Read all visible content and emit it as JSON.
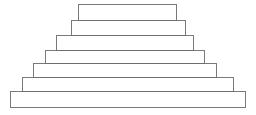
{
  "figure": {
    "background_color": "#ffffff",
    "stroke_color": "#6b6b6b",
    "fill_color": "#ffffff",
    "stroke_width": 0.9,
    "canvas": {
      "width": 256,
      "height": 115
    }
  },
  "chart_data": {
    "type": "bar",
    "title": "",
    "subtitle": "",
    "xlabel": "",
    "ylabel": "",
    "orientation": "horizontal-stacked-pyramid",
    "grid": false,
    "legend": null,
    "categories": [
      "tier-1",
      "tier-2",
      "tier-3",
      "tier-4",
      "tier-5",
      "tier-6",
      "tier-7"
    ],
    "values": [
      98,
      114,
      137,
      159,
      183,
      211,
      235
    ],
    "xlim": [
      0,
      256
    ],
    "ylim": [
      0,
      115
    ],
    "tiers": [
      {
        "index": 1,
        "label": "tier-1",
        "x": 78,
        "y": 4,
        "width": 98,
        "height": 16
      },
      {
        "index": 2,
        "label": "tier-2",
        "x": 71,
        "y": 20,
        "width": 114,
        "height": 15
      },
      {
        "index": 3,
        "label": "tier-3",
        "x": 56,
        "y": 35,
        "width": 137,
        "height": 15
      },
      {
        "index": 4,
        "label": "tier-4",
        "x": 45,
        "y": 50,
        "width": 159,
        "height": 13
      },
      {
        "index": 5,
        "label": "tier-5",
        "x": 33,
        "y": 63,
        "width": 183,
        "height": 14
      },
      {
        "index": 6,
        "label": "tier-6",
        "x": 22,
        "y": 77,
        "width": 211,
        "height": 14
      },
      {
        "index": 7,
        "label": "tier-7",
        "x": 10,
        "y": 91,
        "width": 235,
        "height": 16
      }
    ]
  }
}
